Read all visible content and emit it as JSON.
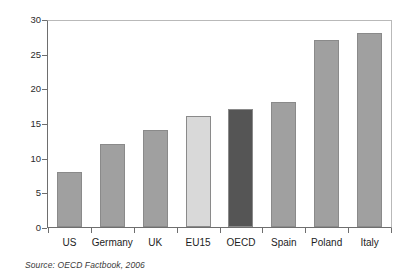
{
  "chart_data": {
    "type": "bar",
    "title": "",
    "subtitle": "",
    "xlabel": "",
    "ylabel": "",
    "categories": [
      "US",
      "Germany",
      "UK",
      "EU15",
      "OECD",
      "Spain",
      "Poland",
      "Italy"
    ],
    "values": [
      8,
      12,
      14,
      16,
      17,
      18,
      27,
      28
    ],
    "series": [
      {
        "name": "value",
        "values": [
          8,
          12,
          14,
          16,
          17,
          18,
          27,
          28
        ]
      }
    ],
    "bar_colors": [
      "#a0a0a0",
      "#a0a0a0",
      "#a0a0a0",
      "#d9d9d9",
      "#555555",
      "#a0a0a0",
      "#a0a0a0",
      "#a0a0a0"
    ],
    "ylim": [
      0,
      30
    ],
    "ytick_values": [
      0,
      5,
      10,
      15,
      20,
      25,
      30
    ],
    "ytick_labels": [
      "0",
      "5",
      "10",
      "15",
      "20",
      "25",
      "30"
    ],
    "grid": false,
    "legend": "none",
    "annotations": [],
    "source_note": "Source:  OECD Factbook, 2006"
  },
  "colors": {
    "background": "#ffffff",
    "bar_default": "#a0a0a0",
    "bar_light": "#d9d9d9",
    "bar_dark": "#555555",
    "bar_border": "#8a8a8a",
    "axis": "#6e6e6e",
    "frame_light": "#b9b9b9",
    "text": "#1d1d1d"
  }
}
